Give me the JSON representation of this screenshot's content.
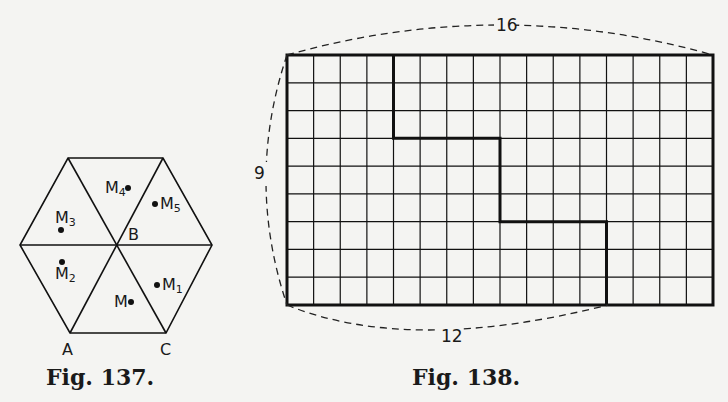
{
  "figures": [
    {
      "caption": "Fig. 137.",
      "type": "hexagon-diagram",
      "vertex_labels": {
        "A": "A",
        "B": "B",
        "C": "C"
      },
      "points": [
        {
          "name": "M",
          "sub": ""
        },
        {
          "name": "M",
          "sub": "1"
        },
        {
          "name": "M",
          "sub": "2"
        },
        {
          "name": "M",
          "sub": "3"
        },
        {
          "name": "M",
          "sub": "4"
        },
        {
          "name": "M",
          "sub": "5"
        }
      ]
    },
    {
      "caption": "Fig. 138.",
      "type": "grid-rectangle",
      "columns": 16,
      "rows": 9,
      "dimension_labels": {
        "top": "16",
        "left": "9",
        "bottom": "12"
      },
      "staircase_cut": [
        [
          4,
          0
        ],
        [
          4,
          3
        ],
        [
          8,
          3
        ],
        [
          8,
          6
        ],
        [
          12,
          6
        ],
        [
          12,
          9
        ]
      ]
    }
  ]
}
